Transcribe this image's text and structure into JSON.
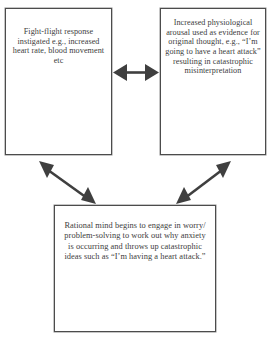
{
  "diagram": {
    "type": "cycle-diagram",
    "title": "",
    "boxes": [
      {
        "id": "fight-flight",
        "text": "Fight-flight response instigated e.g., increased heart rate, blood movement etc",
        "position": "top-left"
      },
      {
        "id": "arousal",
        "text": "Increased physiological arousal used as evidence for original thought, e.g., “I’m going to have a heart attack” resulting in catastrophic misinterpretation",
        "position": "top-right"
      },
      {
        "id": "rational",
        "text": "Rational mind begins to engage in worry/ problem-solving to work out why anxiety is occurring and throws up catastrophic ideas such as “I’m having a heart attack.”",
        "position": "bottom-center"
      }
    ],
    "arrows": [
      {
        "id": "arrow-fight-flight-arousal",
        "kind": "double-headed-arrow",
        "orientation": "horizontal",
        "from": "fight-flight",
        "to": "arousal"
      },
      {
        "id": "arrow-fight-flight-rational",
        "kind": "double-headed-arrow",
        "orientation": "diagonal-down-right",
        "from": "fight-flight",
        "to": "rational"
      },
      {
        "id": "arrow-arousal-rational",
        "kind": "double-headed-arrow",
        "orientation": "diagonal-down-left",
        "from": "arousal",
        "to": "rational"
      }
    ],
    "caption": "",
    "colors": {
      "border": "#4c4c4c",
      "arrow": "#3f3f3f",
      "text": "#3d3d3d",
      "background": "#ffffff"
    }
  }
}
